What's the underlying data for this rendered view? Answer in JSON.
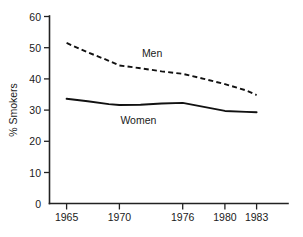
{
  "chart_data": {
    "type": "line",
    "title": "",
    "xlabel": "",
    "ylabel": "% Smokers",
    "xlim": [
      1963.5,
      1984.5
    ],
    "ylim": [
      0,
      60
    ],
    "grid": false,
    "legend_position": "inline-annotations",
    "x_ticks": [
      1965,
      1970,
      1976,
      1980,
      1983
    ],
    "x_tick_labels": [
      "1965",
      "1970",
      "1976",
      "1980",
      "1983"
    ],
    "y_ticks": [
      0,
      10,
      20,
      30,
      40,
      50,
      60
    ],
    "y_tick_labels": [
      "0",
      "10",
      "20",
      "30",
      "40",
      "50",
      "60"
    ],
    "series": [
      {
        "name": "Men",
        "style": "dashed",
        "label": "Men",
        "x": [
          1965,
          1967,
          1969,
          1970,
          1972,
          1974,
          1976,
          1978,
          1980,
          1982,
          1983
        ],
        "values": [
          51.5,
          48.5,
          45.8,
          44.3,
          43.4,
          42.4,
          41.6,
          40.0,
          38.3,
          36.3,
          34.8
        ]
      },
      {
        "name": "Women",
        "style": "solid",
        "label": "Women",
        "x": [
          1965,
          1967,
          1969,
          1970,
          1972,
          1974,
          1976,
          1978,
          1980,
          1982,
          1983
        ],
        "values": [
          33.6,
          32.8,
          31.9,
          31.6,
          31.7,
          32.1,
          32.3,
          31.0,
          29.7,
          29.4,
          29.3
        ]
      }
    ],
    "annotations": [
      {
        "text": "Men",
        "x": 1973.1,
        "y": 46.9
      },
      {
        "text": "Women",
        "x": 1971.8,
        "y": 25.6
      }
    ]
  }
}
